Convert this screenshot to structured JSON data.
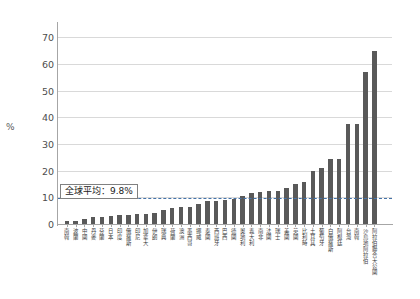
{
  "chart_data": {
    "type": "bar",
    "title": "",
    "xlabel": "",
    "ylabel": "%",
    "ylim": [
      0,
      75
    ],
    "yticks": [
      0,
      10,
      20,
      30,
      40,
      50,
      60,
      70
    ],
    "grid": true,
    "legend": "none",
    "bar_color": "#595959",
    "annotation": {
      "label": "全球平均：9.8%",
      "value": 9.8,
      "line_color": "#4472a8",
      "style": "dashed"
    },
    "categories": [
      "南韓",
      "波蘭",
      "中國",
      "丹麥",
      "芬蘭",
      "日本",
      "印度",
      "俄羅斯",
      "印尼",
      "加拿大",
      "伊朗",
      "瑞典",
      "荷蘭",
      "澳洲",
      "墨西哥",
      "挪威",
      "泰國",
      "西班牙",
      "巴西",
      "德國",
      "奧地利",
      "義大利",
      "南非",
      "法國",
      "瑞士",
      "美國",
      "英國",
      "比利時",
      "土耳其",
      "葡萄牙",
      "白俄羅斯",
      "阿根廷",
      "台灣",
      "南韓",
      "沙烏地阿拉伯",
      "阿拉伯聯合大公國"
    ],
    "values": [
      1.0,
      1.2,
      2.0,
      2.6,
      2.8,
      3.0,
      3.2,
      3.4,
      3.6,
      3.8,
      4.0,
      5.4,
      6.0,
      6.2,
      6.4,
      7.6,
      8.6,
      8.8,
      9.0,
      9.4,
      10.4,
      11.6,
      12.0,
      12.2,
      12.4,
      13.4,
      15.0,
      15.6,
      20.0,
      21.0,
      24.2,
      24.4,
      37.4,
      37.6,
      57.0,
      65.0
    ],
    "units": "percent"
  },
  "axis": {
    "y_unit_label": "%"
  },
  "header": {
    "faint_text": ""
  }
}
